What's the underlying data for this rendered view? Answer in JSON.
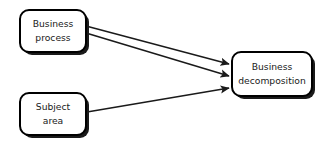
{
  "diagram": {
    "type": "flow-diagram",
    "canvas": {
      "width": 324,
      "height": 152,
      "background": "#ffffff"
    },
    "style": {
      "node_fill": "#ffffff",
      "node_stroke": "#000000",
      "node_stroke_width": 2,
      "node_corner_radius": 9,
      "shadow_color": "#1a1a1a",
      "shadow_offset_x": 3,
      "shadow_offset_y": 3,
      "edge_color": "#1a1a1a",
      "edge_width": 1.4,
      "text_color": "#1a1a1a"
    },
    "nodes": [
      {
        "id": "business-process",
        "label_line1": "Business",
        "label_line2": "process",
        "x": 20,
        "y": 10,
        "width": 66,
        "height": 42
      },
      {
        "id": "subject-area",
        "label_line1": "Subject",
        "label_line2": "area",
        "x": 20,
        "y": 93,
        "width": 66,
        "height": 42
      },
      {
        "id": "business-decomposition",
        "label_line1": "Business",
        "label_line2": "decomposition",
        "x": 232,
        "y": 52,
        "width": 80,
        "height": 44
      }
    ],
    "edges": [
      {
        "id": "edge-process-to-decomposition-upper",
        "from": "business-process",
        "to": "business-decomposition",
        "x1": 86,
        "y1": 26,
        "x2": 229,
        "y2": 64,
        "arrowhead": true
      },
      {
        "id": "edge-process-to-decomposition-lower",
        "from": "business-process",
        "to": "business-decomposition",
        "x1": 86,
        "y1": 33,
        "x2": 229,
        "y2": 76,
        "arrowhead": true
      },
      {
        "id": "edge-subject-to-decomposition",
        "from": "subject-area",
        "to": "business-decomposition",
        "x1": 87,
        "y1": 112,
        "x2": 229,
        "y2": 88,
        "arrowhead": true
      }
    ]
  }
}
